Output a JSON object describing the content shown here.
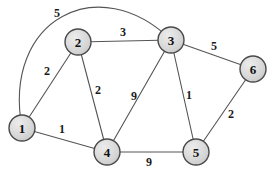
{
  "figure": {
    "background_color": "#ffffff"
  },
  "graph": {
    "style": {
      "node_fill": "#d6d6d6",
      "node_fill_highlight": "#e9e9e9",
      "node_stroke": "#4a4a4a",
      "node_stroke_width": 1.4,
      "node_radius": 13,
      "edge_color": "#555555",
      "edge_width": 1.1,
      "label_color": "#1a1a1a"
    },
    "nodes": [
      {
        "id": "1",
        "label": "1",
        "x": 22,
        "y": 128
      },
      {
        "id": "2",
        "label": "2",
        "x": 78,
        "y": 42
      },
      {
        "id": "3",
        "label": "3",
        "x": 171,
        "y": 40
      },
      {
        "id": "4",
        "label": "4",
        "x": 107,
        "y": 152
      },
      {
        "id": "5",
        "label": "5",
        "x": 196,
        "y": 152
      },
      {
        "id": "6",
        "label": "6",
        "x": 253,
        "y": 69
      }
    ],
    "edges": [
      {
        "from": "1",
        "to": "3",
        "weight": "5",
        "lx": 57,
        "ly": 13,
        "curve": [
          2,
          18,
          100,
          -30
        ]
      },
      {
        "from": "1",
        "to": "2",
        "weight": "2",
        "lx": 47,
        "ly": 71
      },
      {
        "from": "1",
        "to": "4",
        "weight": "1",
        "lx": 62,
        "ly": 129
      },
      {
        "from": "2",
        "to": "3",
        "weight": "3",
        "lx": 123,
        "ly": 32
      },
      {
        "from": "2",
        "to": "4",
        "weight": "2",
        "lx": 98,
        "ly": 90
      },
      {
        "from": "3",
        "to": "4",
        "weight": "9",
        "lx": 134,
        "ly": 96
      },
      {
        "from": "3",
        "to": "5",
        "weight": "1",
        "lx": 189,
        "ly": 95
      },
      {
        "from": "3",
        "to": "6",
        "weight": "5",
        "lx": 214,
        "ly": 46
      },
      {
        "from": "4",
        "to": "5",
        "weight": "9",
        "lx": 149,
        "ly": 162
      },
      {
        "from": "5",
        "to": "6",
        "weight": "2",
        "lx": 231,
        "ly": 114
      }
    ]
  }
}
